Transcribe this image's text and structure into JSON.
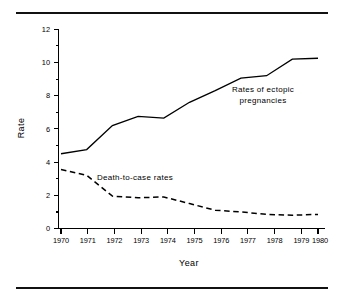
{
  "figure": {
    "background_color": "#ffffff",
    "ink_color": "#000000",
    "top_rule": "horizontal-rule",
    "bottom_rule": "horizontal-rule"
  },
  "chart_data": {
    "type": "line",
    "title": "",
    "xlabel": "Year",
    "ylabel": "Rate",
    "x": [
      1970,
      1971,
      1972,
      1973,
      1974,
      1975,
      1976,
      1977,
      1978,
      1979,
      1980
    ],
    "categories": [
      "1970",
      "1971",
      "1972",
      "1973",
      "1974",
      "1975",
      "1976",
      "1977",
      "1978",
      "1979",
      "1980"
    ],
    "xtick_labels": [
      "1970",
      "1971",
      "1972",
      "1973",
      "1974",
      "1975",
      "1976",
      "1977",
      "1978",
      "1979",
      "1980"
    ],
    "ytick_labels": [
      "0",
      "2",
      "4",
      "6",
      "8",
      "10",
      "12"
    ],
    "yticks": [
      0,
      2,
      4,
      6,
      8,
      10,
      12
    ],
    "ylim": [
      0,
      12
    ],
    "xlim": [
      1970,
      1980
    ],
    "grid": false,
    "legend_position": "inline-annotations",
    "series": [
      {
        "name": "Rates of ectopic pregnancies",
        "style": "solid",
        "values": [
          4.5,
          4.75,
          6.2,
          6.75,
          6.65,
          7.6,
          8.3,
          9.05,
          9.2,
          10.2,
          10.25
        ]
      },
      {
        "name": "Death-to-case rates",
        "style": "dashed",
        "values": [
          3.55,
          3.2,
          1.95,
          1.85,
          1.9,
          1.5,
          1.1,
          1.0,
          0.85,
          0.8,
          0.85
        ]
      }
    ],
    "annotations": [
      {
        "id": "ectopic",
        "lines": [
          "Rates of ectopic",
          "pregnancies"
        ],
        "line1": "Rates of ectopic",
        "line2": "pregnancies"
      },
      {
        "id": "death-to-case",
        "lines": [
          "Death-to-case rates"
        ],
        "line1": "Death-to-case rates"
      }
    ]
  }
}
